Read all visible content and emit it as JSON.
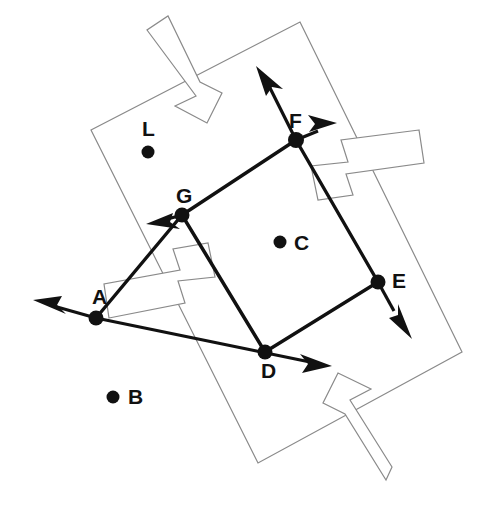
{
  "canvas": {
    "width": 485,
    "height": 507,
    "background": "#ffffff",
    "line_color": "#111111",
    "frame_color": "#8a8a8a"
  },
  "figure": {
    "title": ""
  },
  "points": [
    {
      "id": "A",
      "label": "A",
      "x": 96,
      "y": 318,
      "label_x": 92,
      "label_y": 304,
      "kind": "vertex"
    },
    {
      "id": "B",
      "label": "B",
      "x": 113,
      "y": 397,
      "label_x": 128,
      "label_y": 404,
      "kind": "free"
    },
    {
      "id": "C",
      "label": "C",
      "x": 280,
      "y": 242,
      "label_x": 294,
      "label_y": 250,
      "kind": "free"
    },
    {
      "id": "D",
      "label": "D",
      "x": 265,
      "y": 352,
      "label_x": 261,
      "label_y": 378,
      "kind": "vertex"
    },
    {
      "id": "E",
      "label": "E",
      "x": 378,
      "y": 282,
      "label_x": 392,
      "label_y": 288,
      "kind": "vertex"
    },
    {
      "id": "F",
      "label": "F",
      "x": 296,
      "y": 140,
      "label_x": 289,
      "label_y": 128,
      "kind": "vertex"
    },
    {
      "id": "G",
      "label": "G",
      "x": 182,
      "y": 215,
      "label_x": 176,
      "label_y": 203,
      "kind": "vertex"
    },
    {
      "id": "L",
      "label": "L",
      "x": 148,
      "y": 152,
      "label_x": 142,
      "label_y": 136,
      "kind": "free"
    }
  ],
  "edges": [
    {
      "from": "G",
      "to": "F",
      "style": "solid-thick"
    },
    {
      "from": "F",
      "to": "E",
      "style": "solid-thick"
    },
    {
      "from": "E",
      "to": "D",
      "style": "solid-thick"
    },
    {
      "from": "D",
      "to": "G",
      "style": "solid-thick"
    },
    {
      "from": "A",
      "to": "G",
      "style": "solid-thick"
    }
  ],
  "rays": [
    {
      "id": "ray-A-left",
      "from": "A",
      "tip_x": 35,
      "tip_y": 300,
      "direction": "left"
    },
    {
      "id": "ray-D-right",
      "from": "D",
      "tip_x": 330,
      "tip_y": 365,
      "direction": "right"
    },
    {
      "id": "ray-G-lowleft",
      "from": "G",
      "tip_x": 148,
      "tip_y": 222,
      "direction": "lower-left"
    },
    {
      "id": "ray-F-upleft",
      "from": "F",
      "tip_x": 256,
      "tip_y": 68,
      "direction": "upper-left"
    },
    {
      "id": "ray-F-right",
      "from": "F",
      "tip_x": 335,
      "tip_y": 124,
      "direction": "upper-right"
    },
    {
      "id": "ray-E-downright",
      "from": "E",
      "tip_x": 411,
      "tip_y": 335,
      "direction": "lower-right"
    }
  ],
  "frame": {
    "name": "rotated-rectangle",
    "corners": [
      {
        "x": 300,
        "y": 22
      },
      {
        "x": 462,
        "y": 352
      },
      {
        "x": 258,
        "y": 463
      },
      {
        "x": 91,
        "y": 130
      }
    ]
  },
  "hollow_arrows": [
    {
      "id": "hollow-arrow-top",
      "direction": "up-left",
      "anchor_x": 175,
      "anchor_y": 60
    },
    {
      "id": "hollow-arrow-right",
      "direction": "up-right",
      "anchor_x": 400,
      "anchor_y": 165
    },
    {
      "id": "hollow-arrow-bottom",
      "direction": "down-right",
      "anchor_x": 390,
      "anchor_y": 430
    },
    {
      "id": "hollow-arrow-left",
      "direction": "down-left",
      "anchor_x": 150,
      "anchor_y": 285
    }
  ],
  "style": {
    "vertex_dot_radius": 7,
    "free_dot_radius": 6,
    "label_font_size": 21,
    "edge_width": 3.4
  }
}
